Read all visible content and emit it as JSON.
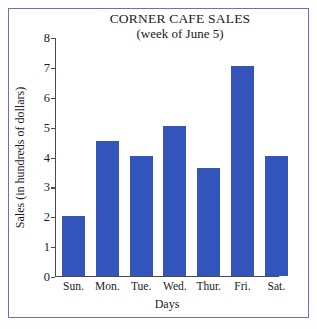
{
  "chart_data": {
    "type": "bar",
    "title": "CORNER CAFE SALES",
    "subtitle": "(week of June 5)",
    "xlabel": "Days",
    "ylabel": "Sales (in hundreds of dollars)",
    "categories": [
      "Sun.",
      "Mon.",
      "Tue.",
      "Wed.",
      "Thur.",
      "Fri.",
      "Sat."
    ],
    "values": [
      2.0,
      4.5,
      4.0,
      5.0,
      3.6,
      7.0,
      4.0
    ],
    "ylim": [
      0,
      8
    ],
    "ytick_labels": [
      "8",
      "7",
      "6",
      "5",
      "4",
      "3",
      "2",
      "1",
      "0"
    ],
    "ytick_values": [
      8,
      7,
      6,
      5,
      4,
      3,
      2,
      1,
      0
    ],
    "grid": false,
    "legend": null,
    "bar_color": "#3355bb",
    "axis_color": "#4a4a4a",
    "frame_color": "#6a6ec8",
    "background": "#ffffff"
  }
}
